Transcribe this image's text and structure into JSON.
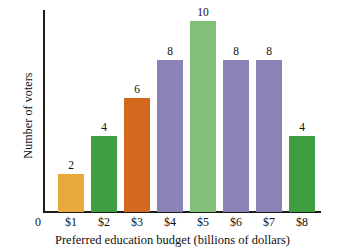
{
  "chart_data": {
    "type": "bar",
    "title": "",
    "xlabel": "Preferred education budget (billions of dollars)",
    "ylabel": "Number of voters",
    "categories": [
      "$1",
      "$2",
      "$3",
      "$4",
      "$5",
      "$6",
      "$7",
      "$8"
    ],
    "values": [
      2,
      4,
      6,
      8,
      10,
      8,
      8,
      4
    ],
    "value_labels": [
      "2",
      "4",
      "6",
      "8",
      "10",
      "8",
      "8",
      "4"
    ],
    "bar_colors": [
      "#e8a93c",
      "#3d9e42",
      "#d2691e",
      "#8983b8",
      "#84bf78",
      "#8983b8",
      "#8983b8",
      "#3d9e42"
    ],
    "origin_label": "0",
    "ylim": [
      0,
      10.6
    ],
    "grid": false,
    "legend": "none",
    "y_tick_labels": [],
    "x_tick_labels": [
      "$1",
      "$2",
      "$3",
      "$4",
      "$5",
      "$6",
      "$7",
      "$8"
    ]
  }
}
